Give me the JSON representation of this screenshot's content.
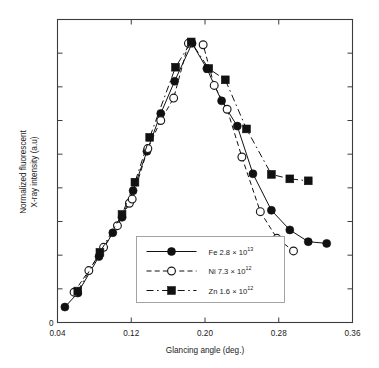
{
  "figure": {
    "name": "fluorescent-xray-vs-glancing-angle"
  },
  "axes": {
    "xlabel": "Glancing angle (deg.)",
    "ylabel_line1": "Normalized fluorescent",
    "ylabel_line2": "X-ray intensity (a.u)",
    "x_ticklabels": [
      "0.04",
      "0.12",
      "0.20",
      "0.28",
      "0.36"
    ],
    "y_ticklabels": [
      "0"
    ],
    "y_zero_label": "0"
  },
  "legend": {
    "entries": [
      {
        "label": "Fe 2.8 × 10",
        "exponent": "13",
        "marker": "filled-circle",
        "line": "solid"
      },
      {
        "label": "Ni 7.3 × 10",
        "exponent": "12",
        "marker": "open-circle",
        "line": "dashed"
      },
      {
        "label": "Zn 1.6 × 10",
        "exponent": "12",
        "marker": "filled-square",
        "line": "mixed"
      }
    ]
  },
  "chart_data": {
    "type": "line",
    "title": "",
    "xlabel": "Glancing angle (deg.)",
    "ylabel": "Normalized fluorescent X-ray intensity (a.u)",
    "xlim": [
      0.04,
      0.36
    ],
    "ylim": [
      0.0,
      1.08
    ],
    "xticks": [
      0.04,
      0.12,
      0.2,
      0.28,
      0.36
    ],
    "yticks": [
      0.0,
      0.12,
      0.24,
      0.36,
      0.48,
      0.6,
      0.72,
      0.84,
      0.96
    ],
    "grid": false,
    "legend_position": "lower-center-inside",
    "series": [
      {
        "name": "Fe 2.8 × 10^13",
        "marker": "filled-circle",
        "line": "solid",
        "color": "#111111",
        "points": [
          [
            0.048,
            0.055
          ],
          [
            0.062,
            0.105
          ],
          [
            0.085,
            0.235
          ],
          [
            0.1,
            0.32
          ],
          [
            0.11,
            0.375
          ],
          [
            0.122,
            0.47
          ],
          [
            0.137,
            0.61
          ],
          [
            0.152,
            0.745
          ],
          [
            0.167,
            0.86
          ],
          [
            0.186,
            0.995
          ],
          [
            0.202,
            0.905
          ],
          [
            0.218,
            0.79
          ],
          [
            0.235,
            0.7
          ],
          [
            0.252,
            0.53
          ],
          [
            0.272,
            0.4
          ],
          [
            0.292,
            0.33
          ],
          [
            0.312,
            0.288
          ],
          [
            0.332,
            0.282
          ]
        ]
      },
      {
        "name": "Ni 7.3 × 10^12",
        "marker": "open-circle",
        "line": "dashed",
        "color": "#111111",
        "points": [
          [
            0.058,
            0.108
          ],
          [
            0.074,
            0.185
          ],
          [
            0.09,
            0.268
          ],
          [
            0.105,
            0.345
          ],
          [
            0.118,
            0.425
          ],
          [
            0.121,
            0.44
          ],
          [
            0.138,
            0.62
          ],
          [
            0.152,
            0.72
          ],
          [
            0.166,
            0.8
          ],
          [
            0.182,
            0.995
          ],
          [
            0.198,
            0.99
          ],
          [
            0.21,
            0.845
          ],
          [
            0.224,
            0.76
          ],
          [
            0.24,
            0.59
          ],
          [
            0.26,
            0.395
          ],
          [
            0.278,
            0.3
          ],
          [
            0.296,
            0.255
          ]
        ]
      },
      {
        "name": "Zn 1.6 × 10^12",
        "marker": "filled-square",
        "line": "mixed",
        "color": "#111111",
        "points": [
          [
            0.062,
            0.112
          ],
          [
            0.086,
            0.25
          ],
          [
            0.11,
            0.385
          ],
          [
            0.124,
            0.5
          ],
          [
            0.14,
            0.66
          ],
          [
            0.168,
            0.91
          ],
          [
            0.185,
            1.0
          ],
          [
            0.204,
            0.905
          ],
          [
            0.222,
            0.865
          ],
          [
            0.245,
            0.69
          ],
          [
            0.272,
            0.528
          ],
          [
            0.292,
            0.512
          ],
          [
            0.312,
            0.505
          ]
        ]
      }
    ]
  }
}
